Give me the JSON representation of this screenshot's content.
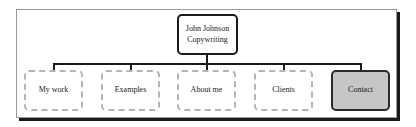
{
  "diagram": {
    "type": "hierarchy",
    "root": {
      "label_line1": "John Johnson",
      "label_line2": "Copywriting"
    },
    "children": [
      {
        "label": "My work",
        "style": "dashed"
      },
      {
        "label": "Examples",
        "style": "dashed"
      },
      {
        "label": "About me",
        "style": "dashed"
      },
      {
        "label": "Clients",
        "style": "dashed"
      },
      {
        "label": "Contact",
        "style": "highlighted"
      }
    ],
    "colors": {
      "highlight_fill": "#c6c6c6",
      "dashed_border": "#b4b4b4",
      "connector": "#1a1a1a"
    }
  }
}
